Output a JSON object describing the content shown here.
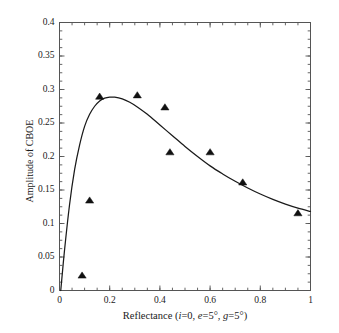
{
  "chart_data": {
    "type": "scatter",
    "title": "",
    "xlabel": "Reflectance (i=0, e=5°, g=5°)",
    "ylabel": "Amplitude of CBOE",
    "xlim": [
      0,
      1
    ],
    "ylim": [
      0,
      0.4
    ],
    "grid": false,
    "legend": null,
    "xticks": [
      "0",
      "0.2",
      "0.4",
      "0.6",
      "0.8",
      "1"
    ],
    "xtick_values": [
      0,
      0.2,
      0.4,
      0.6,
      0.8,
      1
    ],
    "yticks": [
      "0",
      "0.05",
      "0.1",
      "0.15",
      "0.2",
      "0.25",
      "0.3",
      "0.35",
      "0.4"
    ],
    "ytick_values": [
      0,
      0.05,
      0.1,
      0.15,
      0.2,
      0.25,
      0.3,
      0.35,
      0.4
    ],
    "x_minor_tick_step": 0.05,
    "y_minor_tick_step": 0.0125,
    "series": [
      {
        "name": "measurements",
        "type": "scatter",
        "marker": "triangle",
        "color": "#111111",
        "points": [
          {
            "x": 0.09,
            "y": 0.022
          },
          {
            "x": 0.12,
            "y": 0.134
          },
          {
            "x": 0.16,
            "y": 0.289
          },
          {
            "x": 0.31,
            "y": 0.291
          },
          {
            "x": 0.42,
            "y": 0.273
          },
          {
            "x": 0.44,
            "y": 0.206
          },
          {
            "x": 0.6,
            "y": 0.206
          },
          {
            "x": 0.73,
            "y": 0.161
          },
          {
            "x": 0.95,
            "y": 0.115
          }
        ]
      },
      {
        "name": "model-fit",
        "type": "line",
        "color": "#1a1a1a",
        "points": [
          {
            "x": 0.005,
            "y": 0.0
          },
          {
            "x": 0.02,
            "y": 0.06
          },
          {
            "x": 0.04,
            "y": 0.128
          },
          {
            "x": 0.06,
            "y": 0.18
          },
          {
            "x": 0.08,
            "y": 0.217
          },
          {
            "x": 0.1,
            "y": 0.245
          },
          {
            "x": 0.12,
            "y": 0.263
          },
          {
            "x": 0.14,
            "y": 0.275
          },
          {
            "x": 0.16,
            "y": 0.283
          },
          {
            "x": 0.18,
            "y": 0.287
          },
          {
            "x": 0.2,
            "y": 0.2885
          },
          {
            "x": 0.22,
            "y": 0.2885
          },
          {
            "x": 0.25,
            "y": 0.286
          },
          {
            "x": 0.28,
            "y": 0.281
          },
          {
            "x": 0.31,
            "y": 0.274
          },
          {
            "x": 0.35,
            "y": 0.263
          },
          {
            "x": 0.4,
            "y": 0.247
          },
          {
            "x": 0.45,
            "y": 0.231
          },
          {
            "x": 0.5,
            "y": 0.215
          },
          {
            "x": 0.55,
            "y": 0.2
          },
          {
            "x": 0.6,
            "y": 0.186
          },
          {
            "x": 0.65,
            "y": 0.174
          },
          {
            "x": 0.7,
            "y": 0.163
          },
          {
            "x": 0.75,
            "y": 0.153
          },
          {
            "x": 0.8,
            "y": 0.144
          },
          {
            "x": 0.85,
            "y": 0.136
          },
          {
            "x": 0.9,
            "y": 0.129
          },
          {
            "x": 0.95,
            "y": 0.123
          },
          {
            "x": 1.0,
            "y": 0.118
          }
        ]
      }
    ]
  },
  "axes": {
    "y_title": "Amplitude of CBOE",
    "x_title_prefix": "Reflectance (",
    "x_title_i": "i",
    "x_title_i_val": "=0, ",
    "x_title_e": "e",
    "x_title_e_val": "=5°, ",
    "x_title_g": "g",
    "x_title_g_val": "=5°)"
  }
}
